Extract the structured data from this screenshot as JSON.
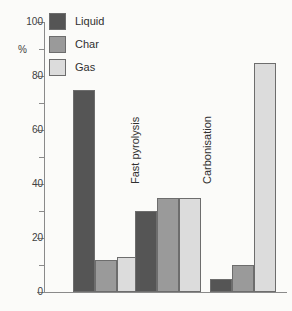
{
  "chart_data": {
    "type": "bar",
    "title": "",
    "subtitle": "",
    "xlabel": "",
    "ylabel": "%",
    "ylim": [
      0,
      100
    ],
    "grid": false,
    "legend_position": "top-left",
    "orientation": "vertical",
    "grouping": "grouped",
    "category_label_rotation": -90,
    "categories": [
      "Fast pyrolysis",
      "Carbonisation",
      "Gasification"
    ],
    "series": [
      {
        "name": "Liquid",
        "color": "#555555",
        "values": [
          75,
          30,
          5
        ]
      },
      {
        "name": "Char",
        "color": "#9a9a9a",
        "values": [
          12,
          35,
          10
        ]
      },
      {
        "name": "Gas",
        "color": "#dcdcdc",
        "values": [
          13,
          35,
          85
        ]
      }
    ],
    "y_ticks_major": [
      0,
      20,
      40,
      60,
      80,
      100
    ],
    "y_ticks_minor": [
      10,
      30,
      50,
      70,
      90
    ],
    "y_tick_labels": [
      "0",
      "20",
      "40",
      "60",
      "80",
      "100"
    ]
  },
  "legend": {
    "items": [
      {
        "label": "Liquid",
        "swatch_color": "#555555"
      },
      {
        "label": "Char",
        "swatch_color": "#9a9a9a"
      },
      {
        "label": "Gas",
        "swatch_color": "#dcdcdc"
      }
    ]
  },
  "axis": {
    "unit_label": "%",
    "labels": {
      "t100": "100",
      "t80": "80",
      "t60": "60",
      "t40": "40",
      "t20": "20",
      "t0": "0"
    }
  },
  "categories": {
    "c0": "Fast pyrolysis",
    "c1": "Carbonisation",
    "c2": "Gasification"
  }
}
